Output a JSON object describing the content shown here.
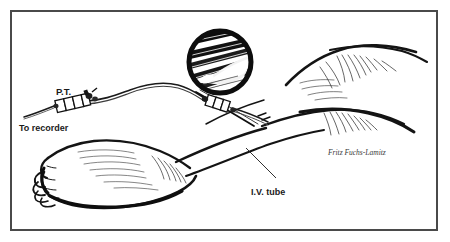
{
  "figure": {
    "type": "medical-line-illustration",
    "background_color": "#ffffff",
    "ink_color": "#111111",
    "frame": {
      "border_color": "#4a4a4a",
      "border_width_px": 2,
      "inset_px": 10
    }
  },
  "labels": {
    "transducer": "P.T.",
    "recorder": "To recorder",
    "iv_tube": "I.V. tube"
  },
  "signature": {
    "text": "Fritz Fuchs-Lamitz"
  },
  "inset": {
    "name": "magnified-detail-circle",
    "center_x": 220,
    "center_y": 62,
    "radius": 33,
    "ring_color": "#0d0d0d",
    "ring_width_px": 5,
    "description": "Magnified view of needle and catheter hub"
  },
  "anatomy": {
    "foot_label": "foot with toes",
    "leg_label": "lower leg and thigh contour"
  }
}
